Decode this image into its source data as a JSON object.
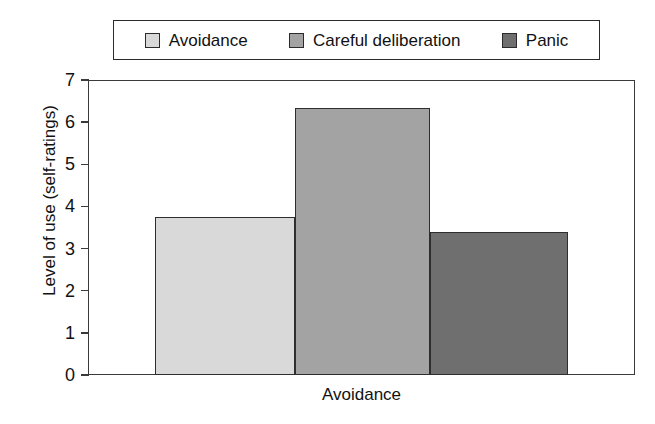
{
  "chart_data": {
    "type": "bar",
    "title": "",
    "subtitle": "",
    "xlabel": "Avoidance",
    "ylabel": "Level of use (self-ratings)",
    "categories": [
      "Avoidance"
    ],
    "grid": false,
    "legend_position": "top",
    "ylim": [
      0,
      7
    ],
    "yticks": [
      0,
      1,
      2,
      3,
      4,
      5,
      6,
      7
    ],
    "ytick_labels": [
      "0",
      "1",
      "2",
      "3",
      "4",
      "5",
      "6",
      "7"
    ],
    "series": [
      {
        "name": "Avoidance",
        "values": [
          3.74
        ],
        "color": "#d9d9d9"
      },
      {
        "name": "Careful deliberation",
        "values": [
          6.33
        ],
        "color": "#a3a3a3"
      },
      {
        "name": "Panic",
        "values": [
          3.4
        ],
        "color": "#6f6f6f"
      }
    ]
  },
  "legend": {
    "entries": [
      {
        "label": "Avoidance",
        "color": "#d9d9d9"
      },
      {
        "label": "Careful deliberation",
        "color": "#a3a3a3"
      },
      {
        "label": "Panic",
        "color": "#6f6f6f"
      }
    ]
  },
  "axes": {
    "y_title": "Level of use (self-ratings)",
    "x_title": "Avoidance",
    "tick_labels": [
      "7",
      "6",
      "5",
      "4",
      "3",
      "2",
      "1",
      "0"
    ]
  },
  "colors": {
    "axis": "#3a3a3a",
    "border": "#2b2b2b",
    "background": "#ffffff",
    "text": "#111111"
  }
}
